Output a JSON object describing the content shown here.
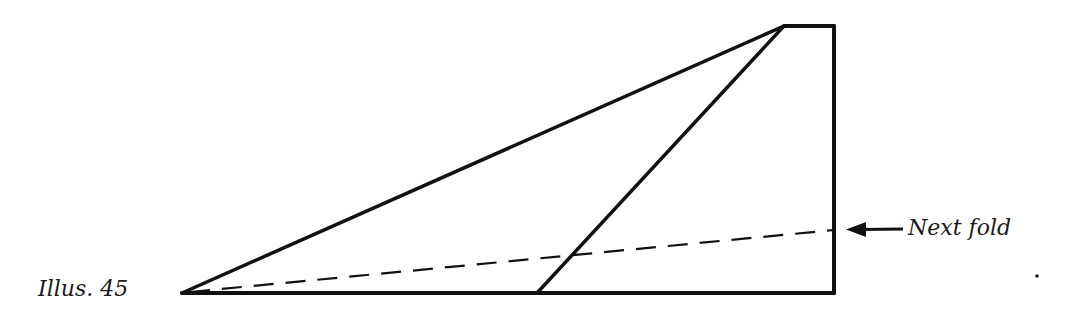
{
  "figure": {
    "caption": "Illus. 45",
    "annotation": {
      "text": "Next fold",
      "arrow_direction": "left",
      "icon": "left-arrow-icon"
    },
    "colors": {
      "stroke": "#111111",
      "background": "#ffffff",
      "text": "#1a1a1a"
    },
    "shapes": {
      "outline_points": [
        [
          182,
          293
        ],
        [
          834,
          293
        ],
        [
          834,
          26
        ],
        [
          784,
          26
        ],
        [
          182,
          293
        ]
      ],
      "inner_fold_line": [
        [
          537,
          293
        ],
        [
          784,
          26
        ]
      ],
      "next_fold_dashed_line": [
        [
          182,
          293
        ],
        [
          834,
          230
        ]
      ],
      "arrow": [
        [
          905,
          229
        ],
        [
          848,
          229
        ]
      ],
      "stray_dot": [
        1037,
        276
      ]
    }
  }
}
